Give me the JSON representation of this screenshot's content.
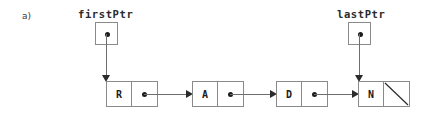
{
  "figure": {
    "part_label": "a)",
    "type": "singly-linked-list-diagram"
  },
  "pointers": [
    {
      "name": "firstPtr",
      "label": "firstPtr",
      "targets": "R"
    },
    {
      "name": "lastPtr",
      "label": "lastPtr",
      "targets": "N"
    }
  ],
  "list": {
    "nodes": [
      {
        "data": "R",
        "link": "pointer"
      },
      {
        "data": "A",
        "link": "pointer"
      },
      {
        "data": "D",
        "link": "pointer"
      },
      {
        "data": "N",
        "link": "null"
      }
    ]
  },
  "colors": {
    "background": "#ffffff",
    "box_border": "#8a8a8a",
    "line": "#6e6e6e",
    "arrow_head": "#2b2b2b",
    "text": "#1c1c1c",
    "fig_label_text": "#3a3a3a"
  }
}
